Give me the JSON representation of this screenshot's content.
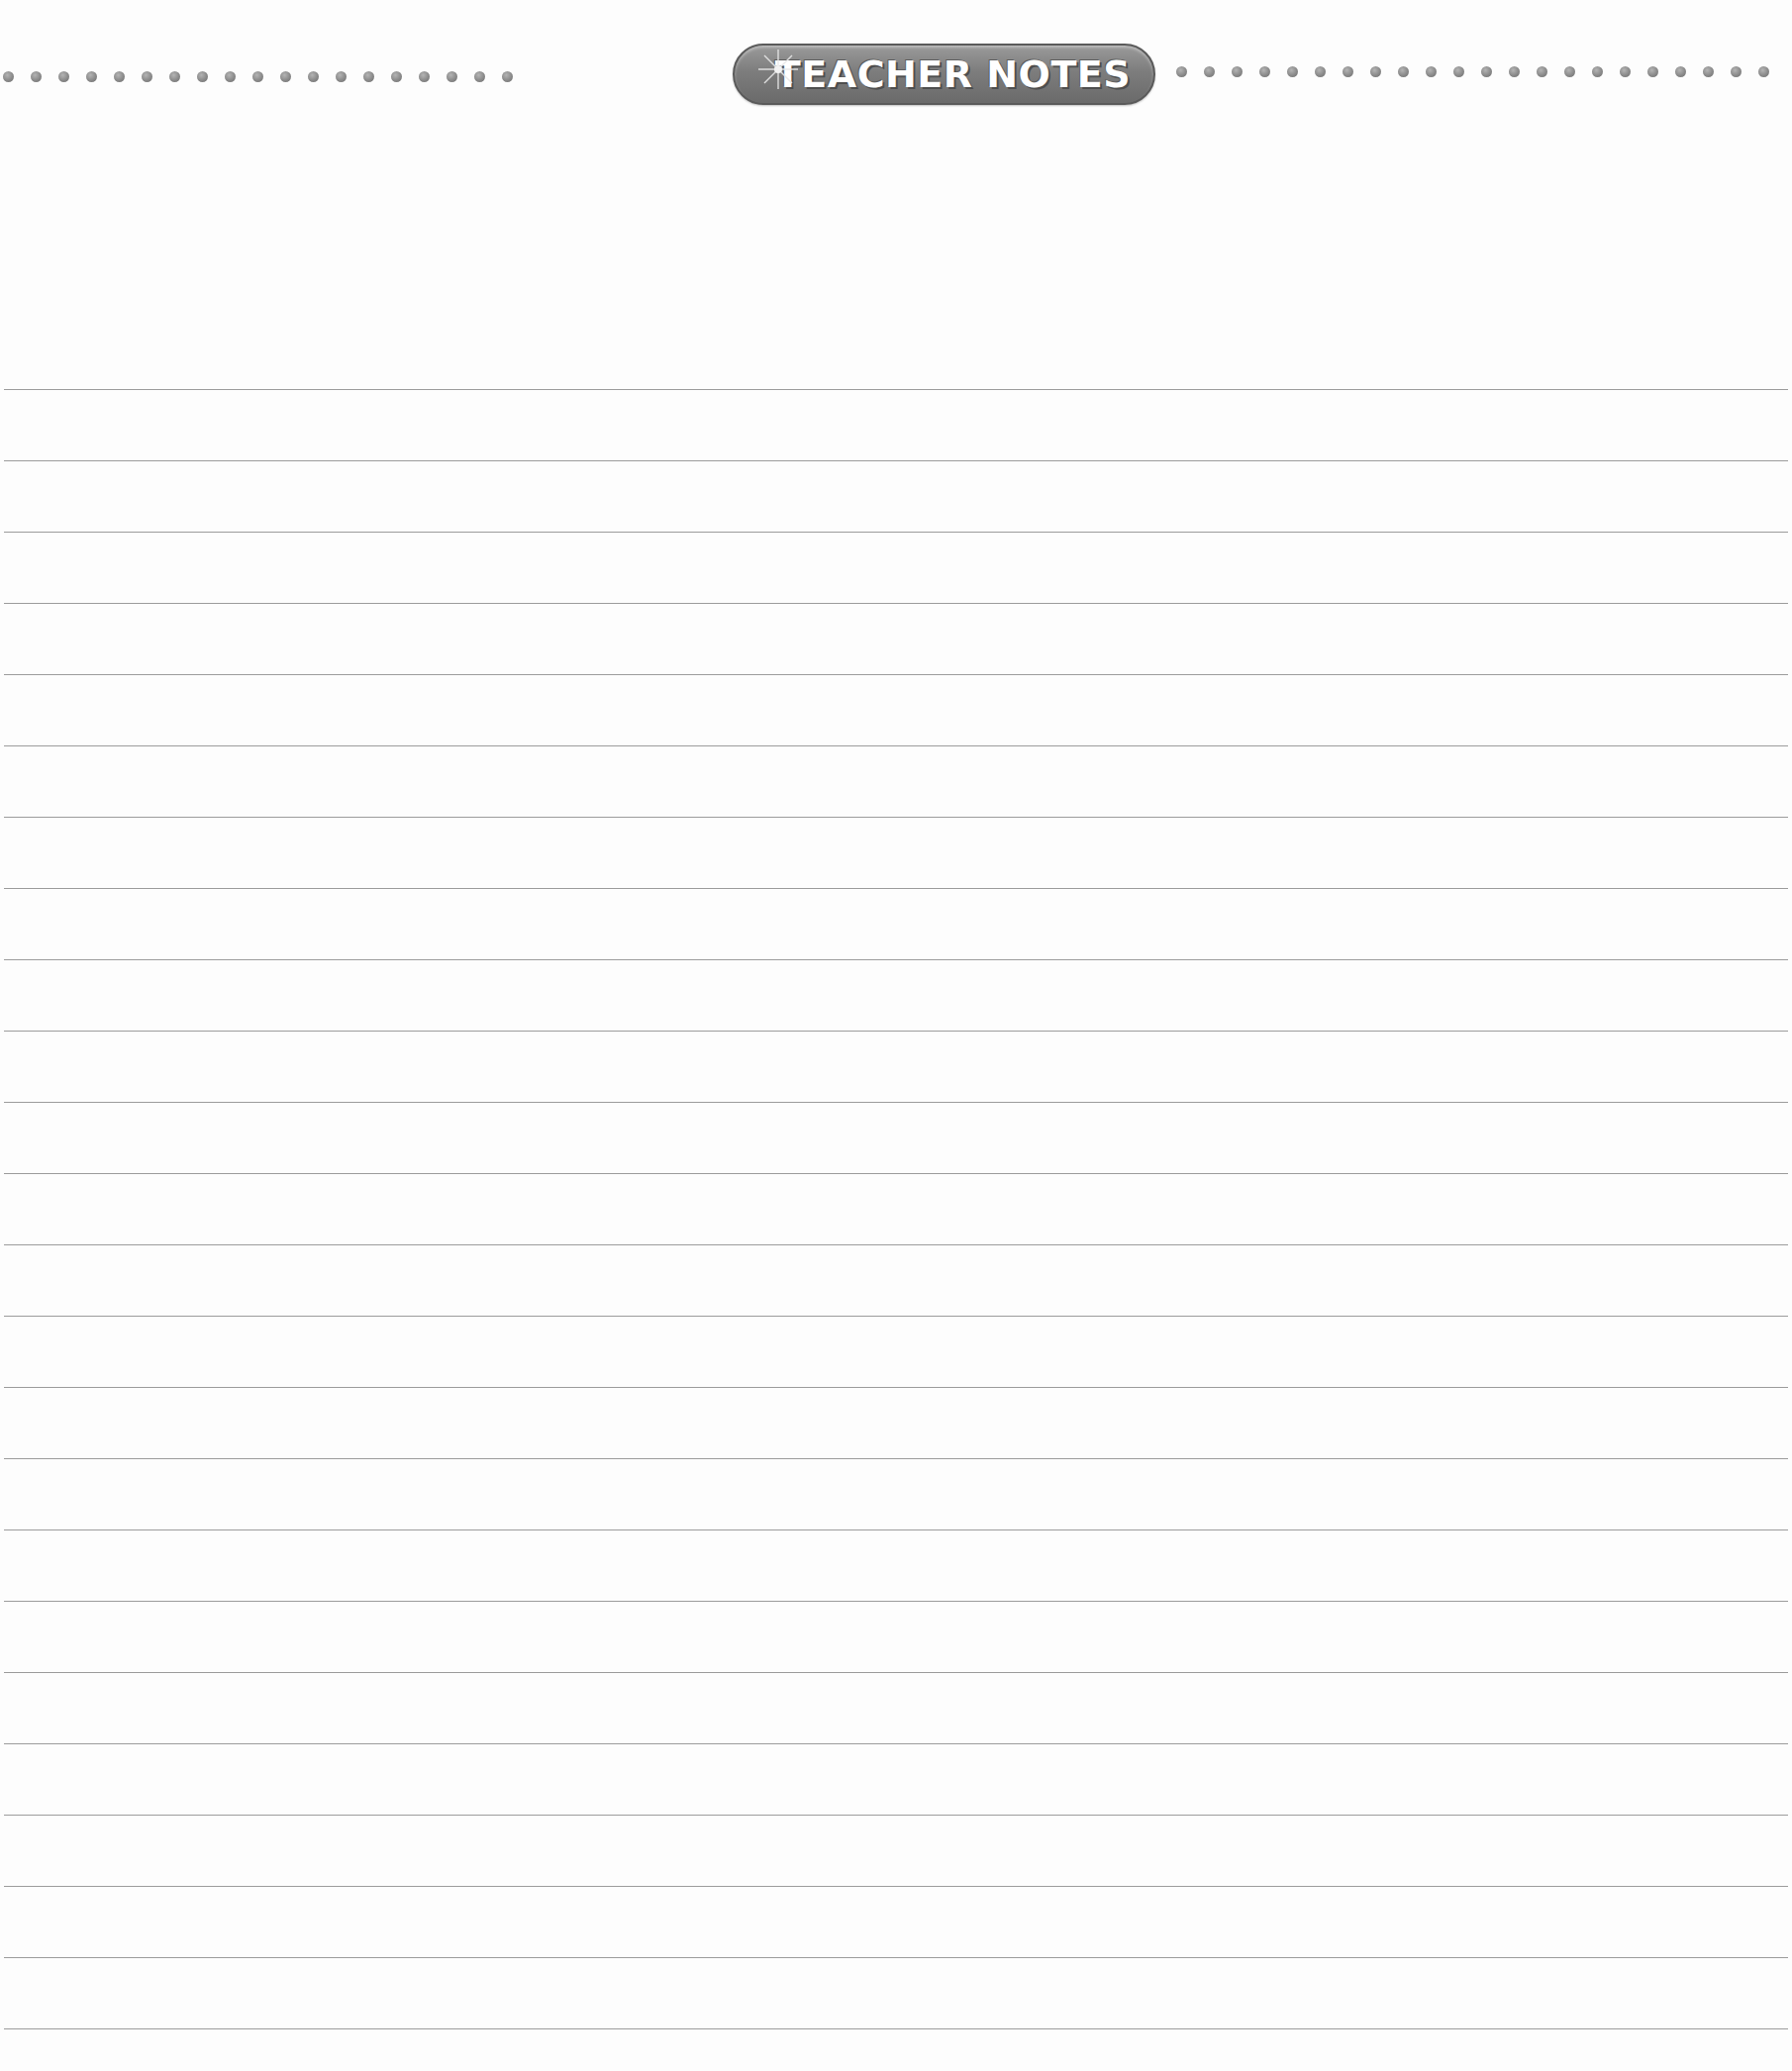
{
  "header": {
    "title": "TEACHER NOTES",
    "left_dot_count": 19,
    "right_dot_count": 22
  },
  "page": {
    "ruled_line_count": 24,
    "line_color": "#9c9c9c",
    "banner_color": "#7d7d7d",
    "background": "#fdfdfd"
  }
}
